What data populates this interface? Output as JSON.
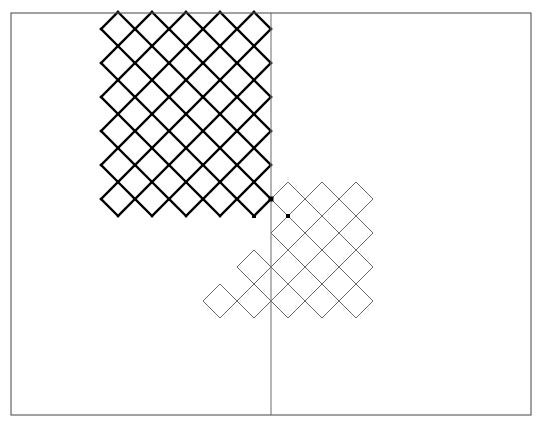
{
  "figure": {
    "canvas": {
      "width": 542,
      "height": 427,
      "background": "#ffffff"
    },
    "colors": {
      "frame": "#555555",
      "axis": "#777777",
      "thin_lattice": "#4d4d4d",
      "bold_boundary": "#000000",
      "marker": "#000000"
    },
    "stroke_widths": {
      "frame": 1.1,
      "axis": 1.1,
      "thin_lattice": 0.85,
      "bold_boundary": 2.3
    },
    "frame": {
      "x": 11,
      "y": 13,
      "width": 520,
      "height": 402
    },
    "axis_line": {
      "name": "vertical-axis",
      "x": 271,
      "y_top": 13,
      "y_bottom": 415
    },
    "lattice": {
      "cell_half_diagonal": 17,
      "cell_pitch": 34,
      "orientation_degrees": 45,
      "description": "square cells rotated 45 degrees forming a diamond grid"
    },
    "cluster_a": {
      "name": "upper-left-cluster",
      "style": "thin lines with bold outer boundary",
      "origin": {
        "x": 271,
        "y": 216
      },
      "cells": [
        [
          -5,
          0
        ],
        [
          -4,
          0
        ],
        [
          -3,
          0
        ],
        [
          -2,
          0
        ],
        [
          -1,
          0
        ],
        [
          -5,
          1
        ],
        [
          -4,
          1
        ],
        [
          -3,
          1
        ],
        [
          -2,
          1
        ],
        [
          -1,
          1
        ],
        [
          -5,
          2
        ],
        [
          -4,
          2
        ],
        [
          -3,
          2
        ],
        [
          -2,
          2
        ],
        [
          -1,
          2
        ],
        [
          -5,
          3
        ],
        [
          -4,
          3
        ],
        [
          -3,
          3
        ],
        [
          -2,
          3
        ],
        [
          -1,
          3
        ],
        [
          -5,
          4
        ],
        [
          -4,
          4
        ],
        [
          -3,
          4
        ],
        [
          -2,
          4
        ],
        [
          -1,
          4
        ],
        [
          -5,
          5
        ],
        [
          -4,
          5
        ],
        [
          -3,
          5
        ],
        [
          -2,
          5
        ],
        [
          -1,
          5
        ]
      ]
    },
    "cluster_b": {
      "name": "lower-right-cluster",
      "style": "thin lines only",
      "origin": {
        "x": 271,
        "y": 216
      },
      "cells": [
        [
          0,
          0
        ],
        [
          1,
          0
        ],
        [
          2,
          0
        ],
        [
          0,
          -1
        ],
        [
          1,
          -1
        ],
        [
          2,
          -1
        ],
        [
          -1,
          -2
        ],
        [
          0,
          -2
        ],
        [
          1,
          -2
        ],
        [
          2,
          -2
        ],
        [
          -2,
          -3
        ],
        [
          -1,
          -3
        ],
        [
          0,
          -3
        ],
        [
          1,
          -3
        ],
        [
          2,
          -3
        ]
      ]
    },
    "markers": [
      {
        "name": "vertex-marker-top",
        "x": 271,
        "y": 199,
        "size": 5
      },
      {
        "name": "vertex-marker-left",
        "x": 254,
        "y": 216,
        "size": 4
      },
      {
        "name": "vertex-marker-right",
        "x": 288,
        "y": 216,
        "size": 4
      }
    ]
  }
}
